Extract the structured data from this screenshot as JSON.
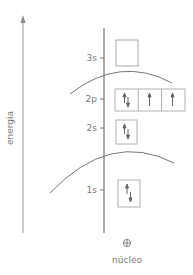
{
  "axis": {
    "label": "energia",
    "color": "#8a8a8a"
  },
  "levels": [
    {
      "name": "3s",
      "orbitals": [
        {
          "electrons": ""
        }
      ]
    },
    {
      "name": "2p",
      "orbitals": [
        {
          "electrons": "up-down"
        },
        {
          "electrons": "up"
        },
        {
          "electrons": "up"
        }
      ]
    },
    {
      "name": "2s",
      "orbitals": [
        {
          "electrons": "up-down"
        }
      ]
    },
    {
      "name": "1s",
      "orbitals": [
        {
          "electrons": "up-down"
        }
      ]
    }
  ],
  "labels": {
    "level_3s": "3s",
    "level_2p": "2p",
    "level_2s": "2s",
    "level_1s": "1s"
  },
  "nucleus": {
    "symbol": "⊕",
    "label": "núcleo"
  },
  "shells": [
    {
      "name": "shell-boundary-outer"
    },
    {
      "name": "shell-boundary-inner"
    }
  ],
  "colors": {
    "line": "#8a8a8a",
    "box": "#b0b0b0",
    "text": "#7a7a7a"
  }
}
